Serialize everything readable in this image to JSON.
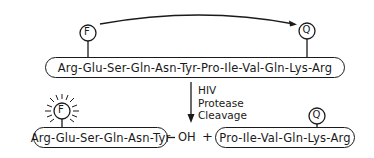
{
  "diagram": {
    "substrate": {
      "sequence": "Arg-Glu-Ser-Gln-Asn-Tyr-Pro-Ile-Val-Gln-Lys-Arg",
      "fluorophore_label": "F",
      "quencher_label": "Q",
      "energy_transfer_arrow": "curved-arrow-F-to-Q"
    },
    "reaction": {
      "arrow_label_lines": [
        "HIV",
        "Protease",
        "Cleavage"
      ]
    },
    "products": {
      "left_fragment": {
        "sequence": "Arg-Glu-Ser-Gln-Asn-Tyr",
        "terminus": "OH",
        "fluorophore_label": "F",
        "fluorophore_state": "fluorescing"
      },
      "plus_sign": "+",
      "right_fragment": {
        "sequence": "Pro-Ile-Val-Gln-Lys-Arg",
        "quencher_label": "Q"
      }
    }
  }
}
